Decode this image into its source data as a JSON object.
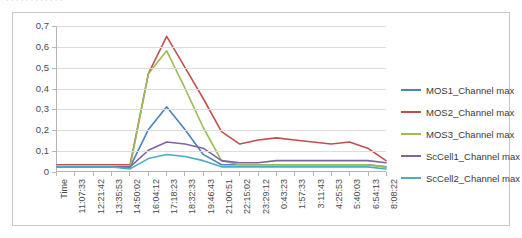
{
  "top_clipped_text": "· · · · · · · · · · · ·",
  "chart_data": {
    "type": "line",
    "title": "",
    "xlabel": "Time",
    "ylabel": "",
    "ylim": [
      0,
      0.7
    ],
    "ytick_labels": [
      "0",
      "0,1",
      "0,2",
      "0,3",
      "0,4",
      "0,5",
      "0,6",
      "0,7"
    ],
    "ytick_values": [
      0,
      0.1,
      0.2,
      0.3,
      0.4,
      0.5,
      0.6,
      0.7
    ],
    "grid": true,
    "legend_position": "right",
    "categories": [
      "Time",
      "11:07:33",
      "12:21:42",
      "13:35:53",
      "14:50:02",
      "16:04:12",
      "17:18:23",
      "18:32:33",
      "19:46:43",
      "21:00:51",
      "22:15:02",
      "23:29:12",
      "0:43:23",
      "1:57:33",
      "3:11:43",
      "4:25:53",
      "5:40:03",
      "6:54:13",
      "8:08:22"
    ],
    "series": [
      {
        "name": "MOS1_Channel max",
        "color": "#4F81BD",
        "values": [
          0.02,
          0.02,
          0.02,
          0.02,
          0.02,
          0.2,
          0.31,
          0.2,
          0.08,
          0.03,
          0.03,
          0.03,
          0.03,
          0.03,
          0.03,
          0.03,
          0.03,
          0.03,
          0.02
        ]
      },
      {
        "name": "MOS2_Channel max",
        "color": "#C0504D",
        "values": [
          0.03,
          0.03,
          0.03,
          0.03,
          0.03,
          0.47,
          0.65,
          0.5,
          0.35,
          0.19,
          0.13,
          0.15,
          0.16,
          0.15,
          0.14,
          0.13,
          0.14,
          0.11,
          0.05
        ]
      },
      {
        "name": "MOS3_Channel max",
        "color": "#9BBB59",
        "values": [
          0.02,
          0.02,
          0.02,
          0.02,
          0.02,
          0.47,
          0.58,
          0.4,
          0.21,
          0.05,
          0.03,
          0.03,
          0.03,
          0.03,
          0.03,
          0.03,
          0.03,
          0.03,
          0.02
        ]
      },
      {
        "name": "ScCell1_Channel max",
        "color": "#8064A2",
        "values": [
          0.02,
          0.02,
          0.02,
          0.02,
          0.02,
          0.1,
          0.14,
          0.13,
          0.11,
          0.05,
          0.04,
          0.04,
          0.05,
          0.05,
          0.05,
          0.05,
          0.05,
          0.05,
          0.04
        ]
      },
      {
        "name": "ScCell2_Channel max",
        "color": "#4BACC6",
        "values": [
          0.02,
          0.02,
          0.02,
          0.02,
          0.01,
          0.06,
          0.08,
          0.07,
          0.05,
          0.02,
          0.02,
          0.02,
          0.02,
          0.02,
          0.02,
          0.02,
          0.02,
          0.02,
          0.01
        ]
      }
    ]
  }
}
